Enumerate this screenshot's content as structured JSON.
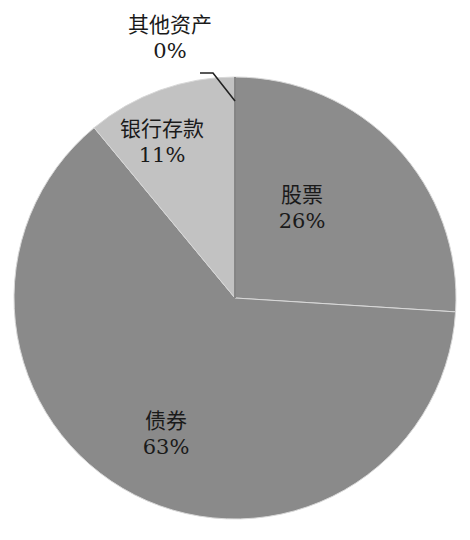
{
  "chart_data": {
    "type": "pie",
    "title": "",
    "start_angle_deg": 0,
    "direction": "clockwise",
    "slices": [
      {
        "label": "股票",
        "value": 26,
        "display": "26%",
        "color": "#8c8c8c"
      },
      {
        "label": "债券",
        "value": 63,
        "display": "63%",
        "color": "#8a8a8a"
      },
      {
        "label": "银行存款",
        "value": 11,
        "display": "11%",
        "color": "#c2c2c2"
      },
      {
        "label": "其他资产",
        "value": 0,
        "display": "0%",
        "color": "#8a8a8a"
      }
    ],
    "legend": "none",
    "data_labels": "category name and percentage, inside slices; 其他资产 label outside with leader line"
  },
  "labels": {
    "stocks": {
      "name": "股票",
      "pct": "26%"
    },
    "bonds": {
      "name": "债券",
      "pct": "63%"
    },
    "deposits": {
      "name": "银行存款",
      "pct": "11%"
    },
    "other": {
      "name": "其他资产",
      "pct": "0%"
    }
  }
}
